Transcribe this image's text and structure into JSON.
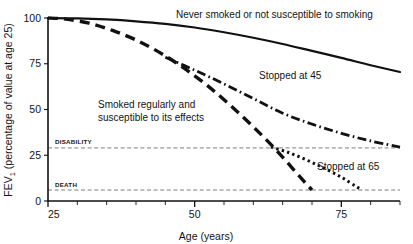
{
  "chart_data": {
    "type": "line",
    "title": "",
    "subtitle": "",
    "xlabel": "Age (years)",
    "ylabel": "FEV₁ (percentage of value at age 25)",
    "ylabel_main": "FEV",
    "ylabel_sub": "1",
    "ylabel_rest": " (percentage of value at age 25)",
    "xlim": [
      25,
      85
    ],
    "ylim": [
      0,
      100
    ],
    "xticks": [
      25,
      50,
      75
    ],
    "xtick_labels": [
      "25",
      "50",
      "75"
    ],
    "xminor_ticks": [
      30,
      35,
      40,
      45,
      55,
      60,
      65,
      70,
      80,
      85
    ],
    "yticks": [
      0,
      25,
      50,
      75,
      100
    ],
    "ytick_labels": [
      "0",
      "25",
      "50",
      "75",
      "100"
    ],
    "grid": false,
    "legend_position": "inline-annotations",
    "threshold_lines": [
      {
        "label": "DISABILITY",
        "value": 29,
        "style": "dashed"
      },
      {
        "label": "DEATH",
        "value": 6,
        "style": "dashed"
      }
    ],
    "series": [
      {
        "name": "Never smoked or not susceptible to smoking",
        "style": "solid",
        "label_x": 52,
        "label_y": 98,
        "points": [
          [
            25,
            100
          ],
          [
            30,
            99.8
          ],
          [
            35,
            99.2
          ],
          [
            40,
            98.2
          ],
          [
            45,
            96.8
          ],
          [
            50,
            94.8
          ],
          [
            55,
            92.2
          ],
          [
            60,
            89.2
          ],
          [
            65,
            85.8
          ],
          [
            70,
            82.0
          ],
          [
            75,
            78.2
          ],
          [
            80,
            74.2
          ],
          [
            85,
            70.5
          ]
        ]
      },
      {
        "name": "Smoked regularly and susceptible to its effects",
        "style": "heavy-dashed",
        "label_line1": "Smoked regularly and",
        "label_line2": "susceptible to its effects",
        "label_x": 38,
        "label_y": 56,
        "points": [
          [
            25,
            100
          ],
          [
            28,
            99.4
          ],
          [
            32,
            97.2
          ],
          [
            36,
            93.2
          ],
          [
            40,
            88.0
          ],
          [
            44,
            81.2
          ],
          [
            48,
            73.0
          ],
          [
            52,
            63.5
          ],
          [
            56,
            52.5
          ],
          [
            60,
            40.5
          ],
          [
            64,
            27.5
          ],
          [
            68,
            13.0
          ],
          [
            70,
            6
          ]
        ]
      },
      {
        "name": "Stopped at 45",
        "style": "dash-dot",
        "label_x": 63,
        "label_y": 62,
        "points": [
          [
            45,
            78.5
          ],
          [
            50,
            71.5
          ],
          [
            55,
            64.0
          ],
          [
            60,
            56.0
          ],
          [
            65,
            48.0
          ],
          [
            70,
            42.0
          ],
          [
            75,
            37.0
          ],
          [
            80,
            32.8
          ],
          [
            85,
            29.5
          ]
        ]
      },
      {
        "name": "Stopped at 65",
        "style": "dotted",
        "label_x": 72,
        "label_y": 22,
        "points": [
          [
            63,
            29.5
          ],
          [
            66,
            26.5
          ],
          [
            69,
            22.5
          ],
          [
            72,
            18.0
          ],
          [
            75,
            13.0
          ],
          [
            77.5,
            8.0
          ],
          [
            78.5,
            6
          ]
        ]
      }
    ]
  },
  "axis": {
    "x_title": "Age (years)",
    "y_title_main": "FEV",
    "y_title_sub": "1",
    "y_title_rest": " (percentage of value at age 25)"
  },
  "labels": {
    "never_smoked": "Never smoked or not susceptible to smoking",
    "smoked_line1": "Smoked regularly and",
    "smoked_line2": "susceptible to its effects",
    "stopped_45": "Stopped at 45",
    "stopped_65": "Stopped at 65",
    "disability": "DISABILITY",
    "death": "DEATH"
  },
  "ticks": {
    "y": [
      "100",
      "75",
      "50",
      "25",
      "0"
    ],
    "x": [
      "25",
      "50",
      "75"
    ]
  },
  "colors": {
    "line": "#111111",
    "threshold": "#6e6e6e",
    "axis": "#111111",
    "background": "#ffffff",
    "text": "#141414"
  }
}
